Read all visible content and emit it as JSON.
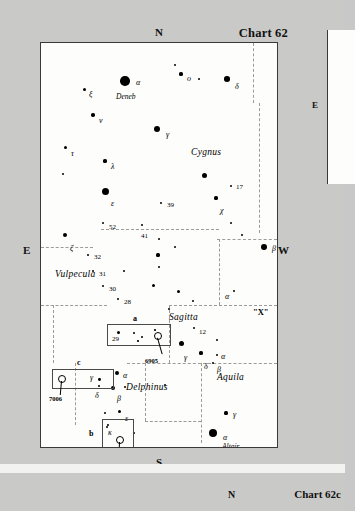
{
  "page": {
    "background_color": "#c9c9c7",
    "paper_color": "#fdfdfb"
  },
  "chart": {
    "title": "Chart 62",
    "cardinals": {
      "north": "N",
      "south": "S",
      "east": "E",
      "west": "W"
    },
    "copyright": "© Stephen James O'Meara",
    "constellations": [
      {
        "name": "Cygnus",
        "x": 150,
        "y": 105
      },
      {
        "name": "Vulpecula",
        "x": 14,
        "y": 227
      },
      {
        "name": "Sagitta",
        "x": 128,
        "y": 270
      },
      {
        "name": "Delphinus",
        "x": 85,
        "y": 340
      },
      {
        "name": "Aquila",
        "x": 176,
        "y": 330
      }
    ],
    "asterism_label": {
      "text": "\"X\"",
      "x": 212,
      "y": 265
    },
    "proper_names": [
      {
        "text": "Deneb",
        "x": 75,
        "y": 50
      },
      {
        "text": "Altair",
        "x": 181,
        "y": 400
      }
    ],
    "stars": [
      {
        "label": "α",
        "name": "alpha-cygni-deneb",
        "x": 84,
        "y": 38,
        "mag_px": 9.5,
        "lx": 95,
        "ly": 36
      },
      {
        "label": "ξ",
        "name": "xi-cygni",
        "x": 43,
        "y": 46,
        "mag_px": 3.0,
        "lx": 48,
        "ly": 48
      },
      {
        "label": "ν",
        "name": "nu-cygni",
        "x": 52,
        "y": 72,
        "mag_px": 3.4,
        "lx": 58,
        "ly": 74
      },
      {
        "label": "ο",
        "name": "omicron-cygni",
        "x": 140,
        "y": 31,
        "mag_px": 3.2,
        "lx": 146,
        "ly": 32
      },
      {
        "label": "",
        "name": "field-star-a",
        "x": 134,
        "y": 22,
        "mag_px": 2.4,
        "lx": 0,
        "ly": 0
      },
      {
        "label": "",
        "name": "field-star-b",
        "x": 158,
        "y": 36,
        "mag_px": 2.0,
        "lx": 0,
        "ly": 0
      },
      {
        "label": "δ",
        "name": "delta-cygni",
        "x": 186,
        "y": 36,
        "mag_px": 5.6,
        "lx": 194,
        "ly": 40
      },
      {
        "label": "γ",
        "name": "gamma-cygni",
        "x": 116,
        "y": 86,
        "mag_px": 6.4,
        "lx": 125,
        "ly": 88
      },
      {
        "label": "τ",
        "name": "tau-cygni",
        "x": 24,
        "y": 104,
        "mag_px": 3.0,
        "lx": 30,
        "ly": 107
      },
      {
        "label": "λ",
        "name": "lambda-cygni",
        "x": 64,
        "y": 118,
        "mag_px": 3.2,
        "lx": 70,
        "ly": 120
      },
      {
        "label": "",
        "name": "field-star-c",
        "x": 22,
        "y": 131,
        "mag_px": 2.6,
        "lx": 0,
        "ly": 0
      },
      {
        "label": "",
        "name": "field-star-d",
        "x": 163,
        "y": 132,
        "mag_px": 5.0,
        "lx": 0,
        "ly": 0
      },
      {
        "label": "17",
        "name": "17-cygni",
        "x": 190,
        "y": 143,
        "mag_px": 2.6,
        "lx": 195,
        "ly": 141
      },
      {
        "label": "ε",
        "name": "epsilon-cygni",
        "x": 64,
        "y": 148,
        "mag_px": 7.0,
        "lx": 70,
        "ly": 157
      },
      {
        "label": "χ",
        "name": "chi-cygni",
        "x": 175,
        "y": 155,
        "mag_px": 3.2,
        "lx": 179,
        "ly": 164
      },
      {
        "label": "39",
        "name": "39-cygni",
        "x": 120,
        "y": 160,
        "mag_px": 2.8,
        "lx": 126,
        "ly": 159
      },
      {
        "label": "52",
        "name": "52-cygni",
        "x": 62,
        "y": 180,
        "mag_px": 2.8,
        "lx": 68,
        "ly": 181
      },
      {
        "label": "41",
        "name": "41-cygni",
        "x": 101,
        "y": 182,
        "mag_px": 2.6,
        "lx": 100,
        "ly": 190
      },
      {
        "label": "",
        "name": "field-star-e",
        "x": 190,
        "y": 180,
        "mag_px": 2.2,
        "lx": 0,
        "ly": 0
      },
      {
        "label": "",
        "name": "field-star-f",
        "x": 201,
        "y": 192,
        "mag_px": 2.2,
        "lx": 0,
        "ly": 0
      },
      {
        "label": "ζ",
        "name": "zeta-cygni",
        "x": 24,
        "y": 192,
        "mag_px": 4.6,
        "lx": 29,
        "ly": 202
      },
      {
        "label": "β",
        "name": "beta-cygni-albireo",
        "x": 223,
        "y": 204,
        "mag_px": 5.8,
        "lx": 231,
        "ly": 202
      },
      {
        "label": "32",
        "name": "32-cygni",
        "x": 47,
        "y": 212,
        "mag_px": 2.8,
        "lx": 53,
        "ly": 211
      },
      {
        "label": "31",
        "name": "31-cygni",
        "x": 52,
        "y": 228,
        "mag_px": 2.8,
        "lx": 58,
        "ly": 228
      },
      {
        "label": "30",
        "name": "30-vulpeculae",
        "x": 62,
        "y": 243,
        "mag_px": 2.6,
        "lx": 68,
        "ly": 243
      },
      {
        "label": "28",
        "name": "28-vulpeculae",
        "x": 77,
        "y": 256,
        "mag_px": 2.8,
        "lx": 83,
        "ly": 256
      },
      {
        "label": "",
        "name": "field-star-g",
        "x": 83,
        "y": 228,
        "mag_px": 2.0,
        "lx": 0,
        "ly": 0
      },
      {
        "label": "",
        "name": "field-star-h",
        "x": 118,
        "y": 224,
        "mag_px": 2.6,
        "lx": 0,
        "ly": 0
      },
      {
        "label": "",
        "name": "field-star-i",
        "x": 112,
        "y": 242,
        "mag_px": 3.0,
        "lx": 0,
        "ly": 0
      },
      {
        "label": "",
        "name": "field-star-j",
        "x": 137,
        "y": 248,
        "mag_px": 3.0,
        "lx": 0,
        "ly": 0
      },
      {
        "label": "",
        "name": "field-star-k",
        "x": 152,
        "y": 258,
        "mag_px": 2.8,
        "lx": 0,
        "ly": 0
      },
      {
        "label": "",
        "name": "field-star-l",
        "x": 128,
        "y": 266,
        "mag_px": 2.6,
        "lx": 0,
        "ly": 0
      },
      {
        "label": "α",
        "name": "alpha-vulpeculae",
        "x": 193,
        "y": 248,
        "mag_px": 2.6,
        "lx": 184,
        "ly": 250
      },
      {
        "label": "12",
        "name": "12-aquilae",
        "x": 153,
        "y": 285,
        "mag_px": 2.8,
        "lx": 158,
        "ly": 286
      },
      {
        "label": "",
        "name": "field-star-m",
        "x": 176,
        "y": 297,
        "mag_px": 2.6,
        "lx": 0,
        "ly": 0
      },
      {
        "label": "γ",
        "name": "gamma-sagittae",
        "x": 140,
        "y": 300,
        "mag_px": 5.0,
        "lx": 143,
        "ly": 311
      },
      {
        "label": "δ",
        "name": "delta-sagittae",
        "x": 160,
        "y": 310,
        "mag_px": 3.2,
        "lx": 163,
        "ly": 320
      },
      {
        "label": "α",
        "name": "alpha-sagittae",
        "x": 176,
        "y": 312,
        "mag_px": 2.8,
        "lx": 180,
        "ly": 310
      },
      {
        "label": "β",
        "name": "beta-sagittae",
        "x": 172,
        "y": 320,
        "mag_px": 2.8,
        "lx": 176,
        "ly": 323
      },
      {
        "label": "α",
        "name": "alpha-delphini",
        "x": 76,
        "y": 330,
        "mag_px": 4.0,
        "lx": 82,
        "ly": 329
      },
      {
        "label": "β",
        "name": "beta-delphini",
        "x": 72,
        "y": 345,
        "mag_px": 4.4,
        "lx": 76,
        "ly": 352
      },
      {
        "label": "δ",
        "name": "delta-delphini",
        "x": 58,
        "y": 343,
        "mag_px": 2.8,
        "lx": 54,
        "ly": 349
      },
      {
        "label": "",
        "name": "field-star-n",
        "x": 84,
        "y": 344,
        "mag_px": 2.8,
        "lx": 0,
        "ly": 0
      },
      {
        "label": "",
        "name": "field-star-o",
        "x": 124,
        "y": 342,
        "mag_px": 2.6,
        "lx": 0,
        "ly": 0
      },
      {
        "label": "ε",
        "name": "epsilon-delphini",
        "x": 78,
        "y": 368,
        "mag_px": 3.0,
        "lx": 84,
        "ly": 372
      },
      {
        "label": "",
        "name": "field-star-p",
        "x": 64,
        "y": 370,
        "mag_px": 2.2,
        "lx": 0,
        "ly": 0
      },
      {
        "label": "κ",
        "name": "kappa-delphini",
        "x": 66,
        "y": 384,
        "mag_px": 2.2,
        "lx": 67,
        "ly": 386
      },
      {
        "label": "",
        "name": "field-star-q",
        "x": 93,
        "y": 390,
        "mag_px": 2.2,
        "lx": 0,
        "ly": 0
      },
      {
        "label": "γ",
        "name": "gamma-aquilae",
        "x": 185,
        "y": 370,
        "mag_px": 3.2,
        "lx": 192,
        "ly": 368
      },
      {
        "label": "α",
        "name": "alpha-aquilae-altair",
        "x": 172,
        "y": 390,
        "mag_px": 8.0,
        "lx": 182,
        "ly": 391
      },
      {
        "label": "",
        "name": "field-star-r",
        "x": 160,
        "y": 414,
        "mag_px": 3.0,
        "lx": 0,
        "ly": 0
      },
      {
        "label": "",
        "name": "field-star-s",
        "x": 134,
        "y": 204,
        "mag_px": 2.6,
        "lx": 0,
        "ly": 0
      },
      {
        "label": "",
        "name": "field-star-t",
        "x": 117,
        "y": 212,
        "mag_px": 3.2,
        "lx": 0,
        "ly": 0
      },
      {
        "label": "",
        "name": "field-star-u",
        "x": 118,
        "y": 196,
        "mag_px": 2.2,
        "lx": 0,
        "ly": 0
      }
    ],
    "insets": [
      {
        "id": "a",
        "name": "inset-box-a",
        "x": 66,
        "y": 281,
        "w": 62,
        "h": 20,
        "id_x": 92,
        "id_y": 272,
        "stars": [
          {
            "label": "29",
            "x": 10,
            "y": 7,
            "mag_px": 3.2,
            "lx": 5,
            "ly": 12
          },
          {
            "label": "",
            "x": 26,
            "y": 8,
            "mag_px": 1.8,
            "lx": 0,
            "ly": 0
          },
          {
            "label": "",
            "x": 34,
            "y": 12,
            "mag_px": 1.8,
            "lx": 0,
            "ly": 0
          },
          {
            "label": "",
            "x": 30,
            "y": 16,
            "mag_px": 1.6,
            "lx": 0,
            "ly": 0
          },
          {
            "label": "",
            "x": 47,
            "y": 5,
            "mag_px": 1.6,
            "lx": 0,
            "ly": 0
          }
        ],
        "dso": {
          "label": "6905",
          "x": 50,
          "y": 11,
          "r": 3.2,
          "leader_len": 17,
          "leader_angle": 74,
          "label_x": 38,
          "label_y": 34
        }
      },
      {
        "id": "c",
        "name": "inset-box-c",
        "x": 11,
        "y": 326,
        "w": 60,
        "h": 18,
        "id_x": 36,
        "id_y": 316,
        "stars": [
          {
            "label": "γ",
            "x": 46,
            "y": 9,
            "mag_px": 2.8,
            "lx": 38,
            "ly": 5
          }
        ],
        "dso": {
          "label": "7006",
          "x": 9,
          "y": 9,
          "r": 3.2,
          "leader_len": 14,
          "leader_angle": 95,
          "label_x": -3,
          "label_y": 27
        }
      },
      {
        "id": "b",
        "name": "inset-box-b",
        "x": 61,
        "y": 376,
        "w": 30,
        "h": 30,
        "id_x": 48,
        "id_y": 387,
        "stars": [
          {
            "label": "",
            "x": 5,
            "y": 5,
            "mag_px": 1.8,
            "lx": 0,
            "ly": 0
          }
        ],
        "dso": {
          "label": "6934",
          "x": 17,
          "y": 20,
          "r": 3.4,
          "leader_len": 16,
          "leader_angle": 92,
          "label_x": 5,
          "label_y": 40
        }
      }
    ]
  },
  "neighbor_right": {
    "cardinal_east": "E"
  },
  "neighbor_bottom": {
    "cardinal_north": "N",
    "title": "Chart 62c"
  }
}
